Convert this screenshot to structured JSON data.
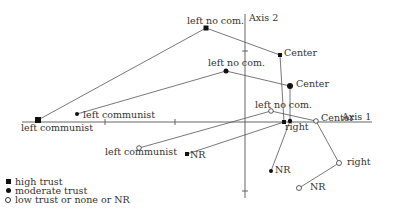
{
  "axes": {
    "axis1_label": "Axis 1",
    "axis2_label": "Axis 2"
  },
  "legend": {
    "items": [
      {
        "marker": "filled-square",
        "label": "high trust"
      },
      {
        "marker": "filled-circle",
        "label": "moderate trust"
      },
      {
        "marker": "open-circle",
        "label": "low trust or none or NR"
      }
    ]
  },
  "series": {
    "high_trust": {
      "marker": "filled-square",
      "points": [
        {
          "label": "left communist",
          "x": 38,
          "y": 120
        },
        {
          "label": "left no com.",
          "x": 206,
          "y": 28
        },
        {
          "label": "Center",
          "x": 280,
          "y": 55
        },
        {
          "label": "right",
          "x": 284,
          "y": 122
        },
        {
          "label": "NR",
          "x": 187,
          "y": 154
        }
      ]
    },
    "moderate_trust": {
      "marker": "filled-circle",
      "points": [
        {
          "label": "left communist",
          "x": 77,
          "y": 114
        },
        {
          "label": "left no com.",
          "x": 226,
          "y": 71
        },
        {
          "label": "Center",
          "x": 290,
          "y": 86
        },
        {
          "label": "right",
          "x": 290,
          "y": 121
        },
        {
          "label": "NR",
          "x": 271,
          "y": 171
        }
      ]
    },
    "low_trust": {
      "marker": "open-circle",
      "points": [
        {
          "label": "left communist",
          "x": 139,
          "y": 148
        },
        {
          "label": "left no com.",
          "x": 271,
          "y": 111
        },
        {
          "label": "Center",
          "x": 316,
          "y": 121
        },
        {
          "label": "right",
          "x": 339,
          "y": 163
        },
        {
          "label": "NR",
          "x": 299,
          "y": 188
        }
      ]
    }
  },
  "labels": {
    "hi_lc": "left communist",
    "hi_lnc": "left no com.",
    "hi_center": "Center",
    "hi_right": "right",
    "hi_nr": "NR",
    "mo_lc": "left communist",
    "mo_lnc": "left no com.",
    "mo_center": "Center",
    "mo_nr": "NR",
    "lo_lc": "left communist",
    "lo_lnc": "left no com.",
    "lo_center": "Center",
    "lo_right": "right",
    "lo_nr": "NR"
  }
}
